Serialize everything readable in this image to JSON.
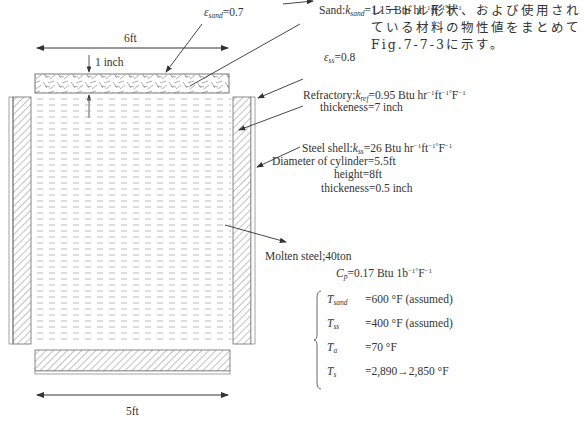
{
  "diagram": {
    "dimensions": {
      "top_width": "6ft",
      "bottom_width": "5ft",
      "lid_thickness": "1 inch"
    },
    "labels": {
      "eps_sand_sym": "ε",
      "eps_sand_sub": "sand",
      "eps_sand_val": "=0.7",
      "sand_prefix": "Sand:",
      "sand_k": "k",
      "sand_k_sub": "sand",
      "sand_val": "=1.15 Btu hr",
      "eps_ss_sym": "ε",
      "eps_ss_sub": "ss",
      "eps_ss_val": "=0.8",
      "refractory_prefix": "Refractory:",
      "ref_k": "k",
      "ref_k_sub": "ref",
      "ref_val": "=0.95 Btu hr",
      "ref_thickness": "thickeness=7 inch",
      "shell_prefix": "Steel shell:",
      "shell_k": "k",
      "shell_k_sub": "ss",
      "shell_val": "=26 Btu hr",
      "unit_exp_hr": "−1",
      "unit_ft": "ft",
      "unit_exp_ft": "−1°",
      "unit_F": "F",
      "unit_exp_F": "−1",
      "diameter": "Diameter of cylinder=5.5ft",
      "height": "height=8ft",
      "shell_thickness": "thickeness=0.5 inch",
      "molten": "Molten steel;40ton",
      "cp_sym": "C",
      "cp_sub": "p",
      "cp_val": "=0.17 Btu 1b",
      "cp_exp1": "−1°",
      "cp_F": "F",
      "cp_exp2": "−1"
    },
    "temperatures": [
      {
        "sym": "T",
        "sub": "sand",
        "value": "=600 °F (assumed)"
      },
      {
        "sym": "T",
        "sub": "ss",
        "value": "=400 °F (assumed)"
      },
      {
        "sym": "T",
        "sub": "a",
        "value": "=70 °F"
      },
      {
        "sym": "T",
        "sub": "s",
        "value": "=2,890→2,850 °F"
      }
    ]
  },
  "side_text": "レードル形状、および使用されている材料の物性値をまとめてFig.7-7-3に示す。",
  "colors": {
    "line": "#333333",
    "hatch": "#666666",
    "liquid_dash": "#999999"
  }
}
